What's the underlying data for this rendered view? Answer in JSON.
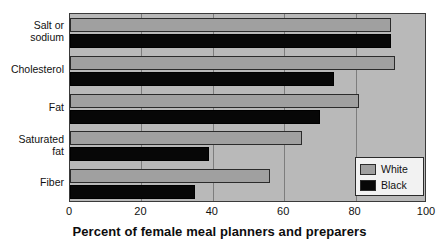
{
  "chart_data": {
    "type": "bar",
    "orientation": "horizontal",
    "title": "",
    "xlabel": "Percent of female meal planners and preparers",
    "ylabel": "",
    "xlim": [
      0,
      100
    ],
    "xticks": [
      0,
      20,
      40,
      60,
      80,
      100
    ],
    "xtick_labels": [
      "0",
      "20",
      "40",
      "60",
      "80",
      "100"
    ],
    "grid": true,
    "grid_axis": "x",
    "legend_position": "bottom-right",
    "categories": [
      "Salt or sodium",
      "Cholesterol",
      "Fat",
      "Saturated fat",
      "Fiber"
    ],
    "series": [
      {
        "name": "White",
        "color": "#a0a0a0",
        "values": [
          90,
          91,
          81,
          65,
          56
        ]
      },
      {
        "name": "Black",
        "color": "#070707",
        "values": [
          90,
          74,
          70,
          39,
          35
        ]
      }
    ]
  },
  "axis": {
    "x_title": "Percent of female meal planners and preparers",
    "tick_labels": [
      "0",
      "20",
      "40",
      "60",
      "80",
      "100"
    ]
  },
  "category_labels": [
    {
      "line1": "Salt or",
      "line2": "sodium"
    },
    {
      "line1": "Cholesterol",
      "line2": ""
    },
    {
      "line1": "Fat",
      "line2": ""
    },
    {
      "line1": "Saturated",
      "line2": "fat"
    },
    {
      "line1": "Fiber",
      "line2": ""
    }
  ],
  "legend": {
    "items": [
      {
        "label": "White",
        "color": "#a0a0a0"
      },
      {
        "label": "Black",
        "color": "#070707"
      }
    ]
  },
  "colors": {
    "plot_background": "#b9b9b9",
    "gridline": "#7d7d7d",
    "axis_border": "#3a3a3a",
    "white_series": "#a0a0a0",
    "black_series": "#070707",
    "legend_background": "#f2f2f2"
  }
}
